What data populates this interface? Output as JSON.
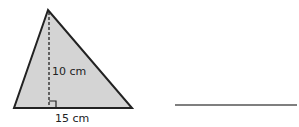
{
  "figure": {
    "shape": "triangle",
    "height_label": "10 cm",
    "base_label": "15 cm",
    "fill_color": "#d4d4d4",
    "stroke_color": "#222222"
  },
  "answer": {
    "line": "blank answer line"
  }
}
